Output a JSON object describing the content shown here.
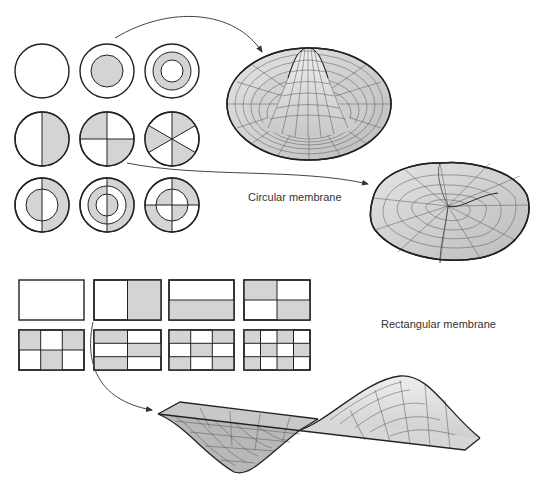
{
  "colors": {
    "outline": "#222222",
    "shade": "#d4d4d4",
    "surface": "#dcdcdc",
    "surface_dark": "#b8b8b8",
    "mesh": "#555555",
    "arrow": "#444444",
    "text": "#333333"
  },
  "labels": {
    "circular": "Circular membrane",
    "rectangular": "Rectangular membrane"
  },
  "circular_modes": {
    "grid": "3x3",
    "radius": 27,
    "items": [
      {
        "row": 0,
        "col": 0,
        "pattern": "plain"
      },
      {
        "row": 0,
        "col": 1,
        "pattern": "inner-disk"
      },
      {
        "row": 0,
        "col": 2,
        "pattern": "ring"
      },
      {
        "row": 1,
        "col": 0,
        "pattern": "half"
      },
      {
        "row": 1,
        "col": 1,
        "pattern": "quarters"
      },
      {
        "row": 1,
        "col": 2,
        "pattern": "sixths"
      },
      {
        "row": 2,
        "col": 0,
        "pattern": "half-with-nodal-circle"
      },
      {
        "row": 2,
        "col": 1,
        "pattern": "half-with-two-nodal-circles"
      },
      {
        "row": 2,
        "col": 2,
        "pattern": "quarters-with-nodal-circle"
      }
    ]
  },
  "rectangular_modes": {
    "items": [
      {
        "row": 0,
        "col": 0,
        "nx": 1,
        "ny": 1
      },
      {
        "row": 0,
        "col": 1,
        "nx": 2,
        "ny": 1
      },
      {
        "row": 0,
        "col": 2,
        "nx": 1,
        "ny": 2
      },
      {
        "row": 0,
        "col": 3,
        "nx": 2,
        "ny": 2
      },
      {
        "row": 1,
        "col": 0,
        "nx": 3,
        "ny": 2
      },
      {
        "row": 1,
        "col": 1,
        "nx": 2,
        "ny": 3
      },
      {
        "row": 1,
        "col": 2,
        "nx": 3,
        "ny": 3
      },
      {
        "row": 1,
        "col": 3,
        "nx": 4,
        "ny": 3
      }
    ]
  },
  "surfaces": [
    {
      "name": "circular-mode-0-1-surface",
      "source": "inner-disk"
    },
    {
      "name": "circular-mode-3-1-surface",
      "source": "quarters"
    },
    {
      "name": "rectangular-mode-2-1-surface",
      "source": "rect-2x1"
    }
  ]
}
